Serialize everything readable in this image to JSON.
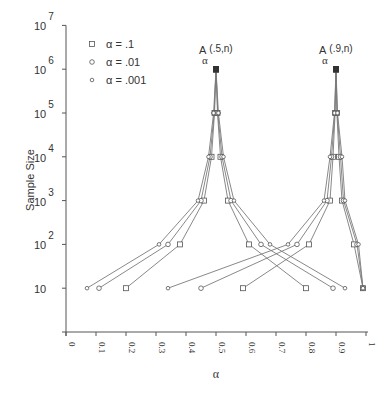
{
  "chart_data": {
    "type": "line",
    "title": "",
    "xlabel": "α",
    "ylabel": "Sample Size",
    "xlim": [
      0,
      1
    ],
    "ylim_log10": [
      0,
      7
    ],
    "y_scale": "log",
    "grid": false,
    "legend_position": "upper-left",
    "x_ticks": [
      "0",
      "0.1",
      "0.2",
      "0.3",
      "0.4",
      "0.5",
      "0.6",
      "0.7",
      "0.8",
      "0.9",
      "1"
    ],
    "y_ticks": [
      {
        "base": "10",
        "exp": "",
        "log10": 1
      },
      {
        "base": "10",
        "exp": "2",
        "log10": 2
      },
      {
        "base": "10",
        "exp": "3",
        "log10": 3
      },
      {
        "base": "10",
        "exp": "4",
        "log10": 4
      },
      {
        "base": "10",
        "exp": "5",
        "log10": 5
      },
      {
        "base": "10",
        "exp": "6",
        "log10": 6
      },
      {
        "base": "10",
        "exp": "7",
        "log10": 7
      }
    ],
    "legend": [
      {
        "marker": "square",
        "label": "α = .1"
      },
      {
        "marker": "circle",
        "label": "α = .01"
      },
      {
        "marker": "small-circle",
        "label": "α = .001"
      }
    ],
    "annotations": [
      {
        "text": "A",
        "sub": "α",
        "suffix": "(.5,n)",
        "x": 0.5
      },
      {
        "text": "A",
        "sub": "α",
        "suffix": "(.9,n)",
        "x": 0.9
      }
    ],
    "sample_sizes_log10": [
      1,
      2,
      3,
      4,
      5,
      6
    ],
    "series": [
      {
        "name": "A(.5,n) α=.1 lower",
        "marker": "square",
        "group": "p=.5",
        "x": [
          0.2,
          0.38,
          0.46,
          0.485,
          0.495,
          0.5
        ],
        "n_log10": [
          1,
          2,
          3,
          4,
          5,
          6
        ]
      },
      {
        "name": "A(.5,n) α=.1 upper",
        "marker": "square",
        "group": "p=.5",
        "x": [
          0.8,
          0.61,
          0.54,
          0.515,
          0.505,
          0.5
        ],
        "n_log10": [
          1,
          2,
          3,
          4,
          5,
          6
        ]
      },
      {
        "name": "A(.5,n) α=.01 lower",
        "marker": "circle",
        "group": "p=.5",
        "x": [
          0.11,
          0.34,
          0.45,
          0.48,
          0.494,
          0.5
        ],
        "n_log10": [
          1,
          2,
          3,
          4,
          5,
          6
        ]
      },
      {
        "name": "A(.5,n) α=.01 upper",
        "marker": "circle",
        "group": "p=.5",
        "x": [
          0.89,
          0.65,
          0.55,
          0.52,
          0.506,
          0.5
        ],
        "n_log10": [
          1,
          2,
          3,
          4,
          5,
          6
        ]
      },
      {
        "name": "A(.5,n) α=.001 lower",
        "marker": "small-circle",
        "group": "p=.5",
        "x": [
          0.07,
          0.31,
          0.44,
          0.475,
          0.492,
          0.5
        ],
        "n_log10": [
          1,
          2,
          3,
          4,
          5,
          6
        ]
      },
      {
        "name": "A(.5,n) α=.001 upper",
        "marker": "small-circle",
        "group": "p=.5",
        "x": [
          0.93,
          0.68,
          0.56,
          0.525,
          0.508,
          0.5
        ],
        "n_log10": [
          1,
          2,
          3,
          4,
          5,
          6
        ]
      },
      {
        "name": "A(.9,n) α=.1 lower",
        "marker": "square",
        "group": "p=.9",
        "x": [
          0.59,
          0.81,
          0.88,
          0.89,
          0.897,
          0.9
        ],
        "n_log10": [
          1,
          2,
          3,
          4,
          5,
          6
        ]
      },
      {
        "name": "A(.9,n) α=.1 upper",
        "marker": "square",
        "group": "p=.9",
        "x": [
          0.99,
          0.96,
          0.92,
          0.91,
          0.903,
          0.9
        ],
        "n_log10": [
          1,
          2,
          3,
          4,
          5,
          6
        ]
      },
      {
        "name": "A(.9,n) α=.01 lower",
        "marker": "circle",
        "group": "p=.9",
        "x": [
          0.45,
          0.77,
          0.87,
          0.885,
          0.896,
          0.9
        ],
        "n_log10": [
          1,
          2,
          3,
          4,
          5,
          6
        ]
      },
      {
        "name": "A(.9,n) α=.01 upper",
        "marker": "circle",
        "group": "p=.9",
        "x": [
          0.99,
          0.97,
          0.925,
          0.915,
          0.904,
          0.9
        ],
        "n_log10": [
          1,
          2,
          3,
          4,
          5,
          6
        ]
      },
      {
        "name": "A(.9,n) α=.001 lower",
        "marker": "small-circle",
        "group": "p=.9",
        "x": [
          0.34,
          0.74,
          0.86,
          0.88,
          0.895,
          0.9
        ],
        "n_log10": [
          1,
          2,
          3,
          4,
          5,
          6
        ]
      },
      {
        "name": "A(.9,n) α=.001 upper",
        "marker": "small-circle",
        "group": "p=.9",
        "x": [
          0.99,
          0.975,
          0.93,
          0.92,
          0.905,
          0.9
        ],
        "n_log10": [
          1,
          2,
          3,
          4,
          5,
          6
        ]
      }
    ]
  },
  "colors": {
    "line": "#7a7a7a",
    "axis": "#555555",
    "text": "#333333",
    "top_marker": "#333333"
  }
}
